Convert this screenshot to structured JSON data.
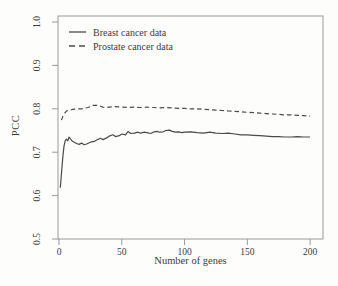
{
  "figure": {
    "background": "#fdfdfb",
    "ink_color": "#3d3d3d",
    "frame_color": "#9a9a9a",
    "curve_color": "#4b4b4b"
  },
  "chart_data": {
    "type": "line",
    "title": "",
    "xlabel": "Number of genes",
    "ylabel": "PCC",
    "xlim": [
      0,
      200
    ],
    "ylim": [
      0.5,
      1.0
    ],
    "x_ticks": [
      0,
      50,
      100,
      150,
      200
    ],
    "y_ticks": [
      0.5,
      0.6,
      0.7,
      0.8,
      0.9,
      1.0
    ],
    "grid": false,
    "legend_position": "top-left",
    "series": [
      {
        "name": "Breast cancer data",
        "style": "solid",
        "color": "#4b4b4b",
        "points": [
          [
            1,
            0.618
          ],
          [
            2,
            0.652
          ],
          [
            3,
            0.688
          ],
          [
            4,
            0.714
          ],
          [
            5,
            0.727
          ],
          [
            6,
            0.73
          ],
          [
            7,
            0.726
          ],
          [
            8,
            0.735
          ],
          [
            9,
            0.731
          ],
          [
            10,
            0.727
          ],
          [
            12,
            0.723
          ],
          [
            14,
            0.72
          ],
          [
            16,
            0.718
          ],
          [
            18,
            0.721
          ],
          [
            20,
            0.717
          ],
          [
            22,
            0.719
          ],
          [
            25,
            0.723
          ],
          [
            28,
            0.725
          ],
          [
            30,
            0.728
          ],
          [
            33,
            0.732
          ],
          [
            35,
            0.729
          ],
          [
            38,
            0.733
          ],
          [
            40,
            0.737
          ],
          [
            43,
            0.74
          ],
          [
            45,
            0.736
          ],
          [
            48,
            0.738
          ],
          [
            50,
            0.742
          ],
          [
            53,
            0.74
          ],
          [
            55,
            0.748
          ],
          [
            57,
            0.743
          ],
          [
            60,
            0.744
          ],
          [
            63,
            0.746
          ],
          [
            65,
            0.744
          ],
          [
            68,
            0.746
          ],
          [
            70,
            0.745
          ],
          [
            73,
            0.743
          ],
          [
            75,
            0.746
          ],
          [
            78,
            0.748
          ],
          [
            80,
            0.746
          ],
          [
            83,
            0.747
          ],
          [
            85,
            0.75
          ],
          [
            88,
            0.751
          ],
          [
            90,
            0.748
          ],
          [
            93,
            0.746
          ],
          [
            95,
            0.747
          ],
          [
            98,
            0.745
          ],
          [
            100,
            0.746
          ],
          [
            105,
            0.747
          ],
          [
            110,
            0.745
          ],
          [
            115,
            0.744
          ],
          [
            120,
            0.746
          ],
          [
            125,
            0.744
          ],
          [
            130,
            0.743
          ],
          [
            135,
            0.744
          ],
          [
            140,
            0.742
          ],
          [
            145,
            0.74
          ],
          [
            150,
            0.74
          ],
          [
            155,
            0.739
          ],
          [
            160,
            0.738
          ],
          [
            165,
            0.737
          ],
          [
            170,
            0.736
          ],
          [
            175,
            0.736
          ],
          [
            180,
            0.735
          ],
          [
            185,
            0.735
          ],
          [
            190,
            0.736
          ],
          [
            195,
            0.735
          ],
          [
            200,
            0.735
          ]
        ]
      },
      {
        "name": "Prostate cancer data",
        "style": "dashed",
        "color": "#4b4b4b",
        "points": [
          [
            2,
            0.774
          ],
          [
            3,
            0.782
          ],
          [
            4,
            0.788
          ],
          [
            5,
            0.792
          ],
          [
            6,
            0.795
          ],
          [
            8,
            0.797
          ],
          [
            10,
            0.798
          ],
          [
            12,
            0.799
          ],
          [
            15,
            0.8
          ],
          [
            18,
            0.8
          ],
          [
            20,
            0.801
          ],
          [
            23,
            0.803
          ],
          [
            25,
            0.805
          ],
          [
            27,
            0.808
          ],
          [
            30,
            0.808
          ],
          [
            33,
            0.806
          ],
          [
            35,
            0.804
          ],
          [
            38,
            0.803
          ],
          [
            40,
            0.804
          ],
          [
            45,
            0.805
          ],
          [
            50,
            0.804
          ],
          [
            55,
            0.803
          ],
          [
            60,
            0.804
          ],
          [
            65,
            0.803
          ],
          [
            70,
            0.804
          ],
          [
            75,
            0.803
          ],
          [
            80,
            0.802
          ],
          [
            85,
            0.803
          ],
          [
            90,
            0.802
          ],
          [
            95,
            0.801
          ],
          [
            100,
            0.801
          ],
          [
            105,
            0.8
          ],
          [
            110,
            0.8
          ],
          [
            115,
            0.799
          ],
          [
            120,
            0.798
          ],
          [
            125,
            0.797
          ],
          [
            130,
            0.796
          ],
          [
            135,
            0.795
          ],
          [
            140,
            0.794
          ],
          [
            145,
            0.793
          ],
          [
            150,
            0.792
          ],
          [
            155,
            0.791
          ],
          [
            160,
            0.79
          ],
          [
            165,
            0.789
          ],
          [
            170,
            0.788
          ],
          [
            175,
            0.787
          ],
          [
            180,
            0.786
          ],
          [
            185,
            0.786
          ],
          [
            190,
            0.785
          ],
          [
            195,
            0.784
          ],
          [
            200,
            0.783
          ]
        ]
      }
    ]
  }
}
